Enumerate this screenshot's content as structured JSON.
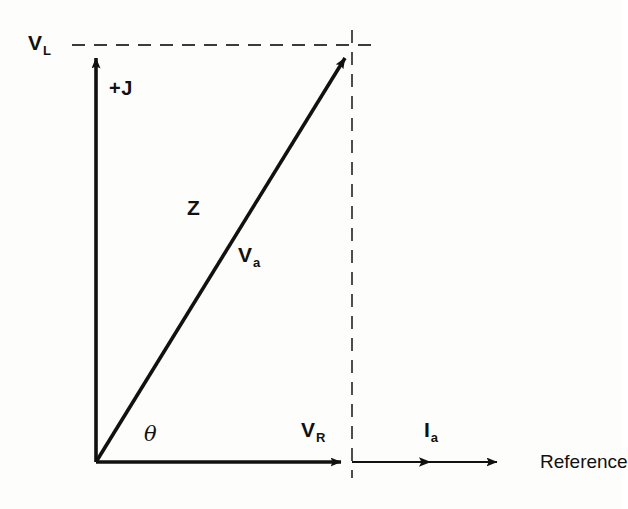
{
  "figure": {
    "type": "phasor-diagram",
    "title": "",
    "background_color": "#fdfdfb",
    "stroke_color": "#111111"
  },
  "axes": {
    "origin": {
      "x": 96,
      "y": 462
    },
    "imaginary_axis": {
      "label": "+J",
      "label_sub": "",
      "from": {
        "x": 96,
        "y": 462
      },
      "to": {
        "x": 96,
        "y": 47
      },
      "arrow": "up"
    },
    "real_axis": {
      "label": "Reference",
      "from": {
        "x": 96,
        "y": 462
      },
      "to": {
        "x": 508,
        "y": 462
      },
      "arrow": "right"
    }
  },
  "labels": {
    "v_l": {
      "text": "V",
      "sub": "L"
    },
    "plus_j": {
      "text": "+J"
    },
    "z": {
      "text": "Z"
    },
    "v_a": {
      "text": "V",
      "sub": "a"
    },
    "theta": {
      "text": "θ"
    },
    "v_r": {
      "text": "V",
      "sub": "R"
    },
    "i_a": {
      "text": "I",
      "sub": "a"
    },
    "reference": {
      "text": "Reference"
    }
  },
  "phasors": [
    {
      "name": "V_a",
      "label": "Va",
      "from": {
        "x": 96,
        "y": 462
      },
      "to": {
        "x": 352,
        "y": 48
      },
      "style": "solid",
      "arrow": true
    },
    {
      "name": "V_R",
      "label": "VR",
      "from": {
        "x": 96,
        "y": 462
      },
      "to": {
        "x": 352,
        "y": 462
      },
      "style": "solid",
      "arrow": true
    },
    {
      "name": "V_L",
      "label": "VL",
      "from": {
        "x": 96,
        "y": 462
      },
      "to": {
        "x": 96,
        "y": 47
      },
      "style": "solid",
      "arrow": true
    },
    {
      "name": "I_a",
      "label": "Ia",
      "from": {
        "x": 352,
        "y": 462
      },
      "to": {
        "x": 508,
        "y": 462
      },
      "style": "solid",
      "arrow": true
    }
  ],
  "construction_lines": [
    {
      "name": "horizontal-projection",
      "from": {
        "x": 72,
        "y": 45
      },
      "to": {
        "x": 376,
        "y": 45
      },
      "style": "dashed"
    },
    {
      "name": "vertical-projection",
      "from": {
        "x": 352,
        "y": 30
      },
      "to": {
        "x": 352,
        "y": 478
      },
      "style": "dashed"
    }
  ],
  "angle": {
    "symbol": "θ",
    "between": [
      "Reference",
      "V_a"
    ]
  }
}
